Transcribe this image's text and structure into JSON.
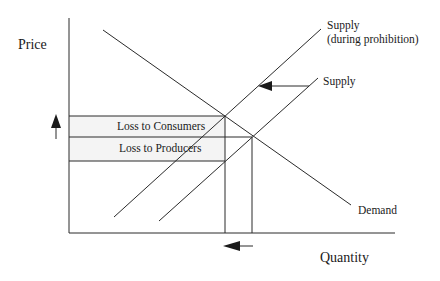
{
  "diagram": {
    "title": "",
    "type": "supply-demand",
    "axes": {
      "y_label": "Price",
      "x_label": "Quantity"
    },
    "curves": {
      "supply_prohibition": {
        "label_line1": "Supply",
        "label_line2": "(during prohibition)"
      },
      "supply": {
        "label": "Supply"
      },
      "demand": {
        "label": "Demand"
      }
    },
    "regions": {
      "consumers": {
        "label": "Loss to Consumers"
      },
      "producers": {
        "label": "Loss to Producers"
      }
    },
    "arrows": [
      {
        "name": "supply-shift-arrow",
        "direction": "left"
      },
      {
        "name": "price-increase-arrow",
        "direction": "up"
      },
      {
        "name": "quantity-decrease-arrow",
        "direction": "left"
      }
    ],
    "colors": {
      "line": "#2a2a2a",
      "band_fill": "#f3f3f3"
    }
  }
}
